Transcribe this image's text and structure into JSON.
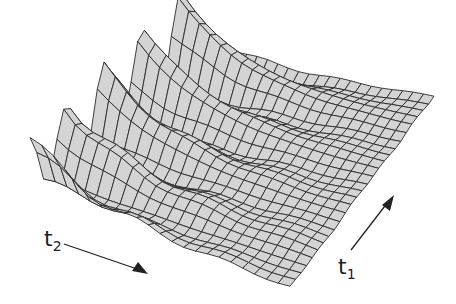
{
  "chart_data": {
    "type": "surface",
    "title": "",
    "axes": {
      "t1": {
        "label": "t",
        "subscript": "1",
        "direction": "up-right"
      },
      "t2": {
        "label": "t",
        "subscript": "2",
        "direction": "down-right"
      }
    },
    "grid": {
      "n_t2": 22,
      "n_t1": 26
    },
    "surface": {
      "peaks_along_t1": 5,
      "peak_height_px": 85,
      "decay_along_t2": 0.28,
      "ripple_height_px": 8,
      "fill_color": "#d4d4d4",
      "line_color": "#2a2a2a"
    },
    "corners_px": {
      "t2min_t1min": [
        30,
        200
      ],
      "t2max_t1min": [
        290,
        288
      ],
      "t2max_t1max": [
        434,
        97
      ],
      "t2min_t1max": [
        205,
        62
      ]
    },
    "grid_on": false,
    "legend": null
  },
  "labels": {
    "t1": {
      "base": "t",
      "sub": "1"
    },
    "t2": {
      "base": "t",
      "sub": "2"
    }
  }
}
